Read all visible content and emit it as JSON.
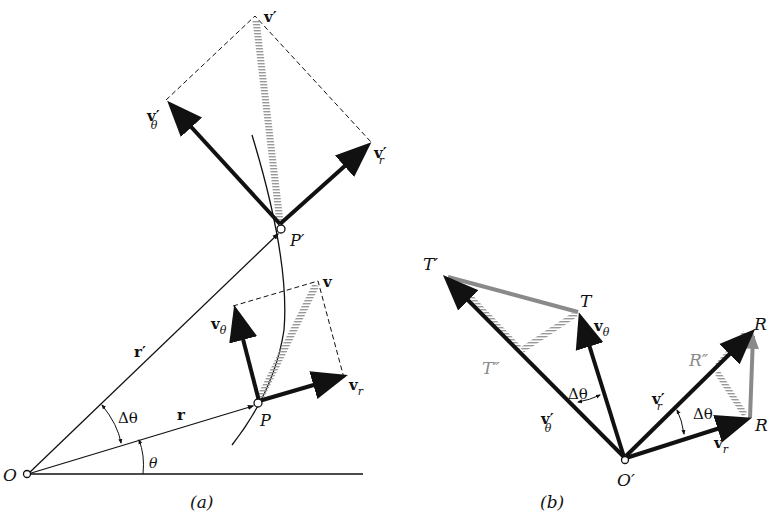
{
  "figure": {
    "panel_a": {
      "caption": "(a)",
      "labels": {
        "origin": "O",
        "point_P": "P",
        "point_P_prime": "P′",
        "r": "r",
        "r_prime": "r′",
        "delta_theta": "Δθ",
        "theta": "θ",
        "v": "v",
        "v_theta": "v",
        "v_theta_sub": "θ",
        "v_r": "v",
        "v_r_sub": "r",
        "v_prime": "v′",
        "v_theta_prime": "v′",
        "v_theta_prime_sub": "θ",
        "v_r_prime": "v′",
        "v_r_prime_sub": "r"
      }
    },
    "panel_b": {
      "caption": "(b)",
      "labels": {
        "origin": "O′",
        "T": "T",
        "T_prime": "T′",
        "T_double_prime": "T″",
        "R": "R",
        "R_prime": "R",
        "R_double_prime": "R″",
        "v_theta": "v",
        "v_theta_sub": "θ",
        "v_theta_prime": "v′",
        "v_theta_prime_sub": "θ",
        "v_r": "v",
        "v_r_sub": "r",
        "v_r_prime": "v′",
        "v_r_prime_sub": "r",
        "delta_theta_left": "Δθ",
        "delta_theta_right": "Δθ"
      }
    },
    "colors": {
      "ink": "#111111",
      "gray_vector": "#8a8a8a",
      "hatch": "#a9a9a9"
    }
  }
}
